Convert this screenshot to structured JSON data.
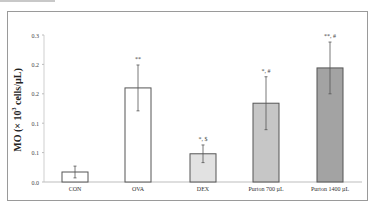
{
  "chart_data": {
    "type": "bar",
    "title": "",
    "xlabel": "",
    "ylabel": "MO (× 10³ cells/µL)",
    "ylabel_parts": {
      "prefix": "MO (× 10",
      "sup": "3",
      "suffix": " cells/µL)"
    },
    "ylim": [
      0,
      0.25
    ],
    "yticks": [
      "0.0",
      "0.1",
      "0.1",
      "0.2",
      "0.2",
      "0.3"
    ],
    "grid": false,
    "legend": null,
    "categories": [
      "CON",
      "OVA",
      "DEX",
      "Purton 700 µL",
      "Purton 1400 µL"
    ],
    "values": [
      0.017,
      0.16,
      0.048,
      0.134,
      0.194
    ],
    "errors": [
      0.01,
      0.039,
      0.015,
      0.045,
      0.044
    ],
    "annotations": [
      "",
      "**",
      "*, $",
      "*, #",
      "**, #"
    ],
    "bar_colors": [
      "#ffffff",
      "#ffffff",
      "#e2e2e2",
      "#c6c6c6",
      "#a3a3a3"
    ],
    "bar_border_color": "#555555"
  }
}
